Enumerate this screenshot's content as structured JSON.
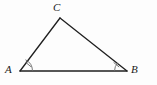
{
  "figure": {
    "background_color": "#fdfdfd",
    "stroke_color": "#1f1f1f",
    "mark_color": "#6b6b6b",
    "width": 157,
    "height": 85
  },
  "vertices": [
    {
      "name": "A",
      "label": "A",
      "x": 20,
      "y": 71,
      "label_x": 5,
      "label_y": 64
    },
    {
      "name": "B",
      "label": "B",
      "x": 127,
      "y": 71,
      "label_x": 131,
      "label_y": 64
    },
    {
      "name": "C",
      "label": "C",
      "x": 60,
      "y": 18,
      "label_x": 53,
      "label_y": 2
    }
  ],
  "sides": [
    {
      "name": "side-AB",
      "from": "A",
      "to": "B"
    },
    {
      "name": "side-AC",
      "from": "A",
      "to": "C"
    },
    {
      "name": "side-CB",
      "from": "C",
      "to": "B"
    }
  ],
  "angle_marks": [
    {
      "name": "angle-A",
      "vertex": "A",
      "arcs": 1,
      "ticks": 1,
      "arc_path": "M 32.5 71 A 12.5 12.5 0 0 0 25.45 59.75",
      "tick_path": "M 25.8 62.4 L 31.4 67.1"
    },
    {
      "name": "angle-B",
      "vertex": "B",
      "arcs": 1,
      "ticks": 1,
      "arc_path": "M 114.5 71 A 12.5 12.5 0 0 1 117.6 62.9",
      "tick_path": "M 113.6 62.4 L 119.2 67.1"
    }
  ],
  "labels": {
    "A": "A",
    "B": "B",
    "C": "C"
  }
}
